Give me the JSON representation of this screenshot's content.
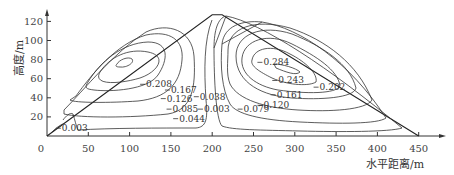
{
  "chart_data": {
    "type": "contour",
    "title": "",
    "xlabel": "水平距离/m",
    "ylabel": "高度/m",
    "xlim": [
      0,
      460
    ],
    "ylim": [
      0,
      130
    ],
    "xticks": [
      0,
      50,
      100,
      150,
      200,
      250,
      300,
      350,
      400,
      450
    ],
    "yticks": [
      20,
      40,
      60,
      80,
      100,
      120
    ],
    "x_tick_labels": [
      "0",
      "50",
      "100",
      "150",
      "200",
      "250",
      "300",
      "350",
      "400",
      "450"
    ],
    "y_tick_labels": [
      "20",
      "40",
      "60",
      "80",
      "100",
      "120"
    ],
    "origin_label": "0",
    "domain_outline": {
      "shape": "triangle",
      "vertices": [
        [
          0,
          0
        ],
        [
          200,
          127
        ],
        [
          212,
          127
        ],
        [
          450,
          0
        ]
      ]
    },
    "grid": false,
    "legend": "none",
    "left_cell": {
      "center": [
        100,
        52
      ],
      "levels": [
        0.208,
        0.167,
        0.126,
        0.085,
        0.044,
        0.003
      ]
    },
    "right_cell": {
      "center": [
        280,
        72
      ],
      "levels": [
        0.284,
        0.243,
        0.202,
        0.161,
        0.12,
        0.079,
        0.038
      ]
    },
    "contour_labels": [
      {
        "text": "0.208",
        "x": 120,
        "y": 51
      },
      {
        "text": "0.167",
        "x": 150,
        "y": 45
      },
      {
        "text": "0.126",
        "x": 145,
        "y": 36
      },
      {
        "text": "0.085",
        "x": 152,
        "y": 25
      },
      {
        "text": "0.044",
        "x": 160,
        "y": 15
      },
      {
        "text": "0.003",
        "x": 18,
        "y": 5
      },
      {
        "text": "0.003",
        "x": 190,
        "y": 25
      },
      {
        "text": "0.038",
        "x": 185,
        "y": 38
      },
      {
        "text": "0.079",
        "x": 238,
        "y": 25
      },
      {
        "text": "0.120",
        "x": 262,
        "y": 29
      },
      {
        "text": "0.161",
        "x": 278,
        "y": 40
      },
      {
        "text": "0.202",
        "x": 330,
        "y": 48
      },
      {
        "text": "0.243",
        "x": 280,
        "y": 55
      },
      {
        "text": "0.284",
        "x": 262,
        "y": 74
      }
    ]
  }
}
